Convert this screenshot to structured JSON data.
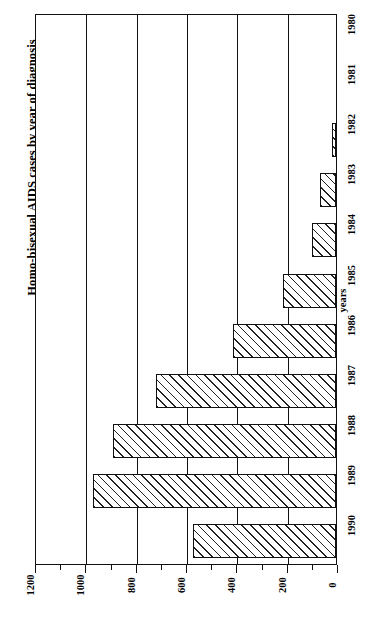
{
  "chart_data": {
    "type": "bar",
    "orientation": "horizontal",
    "title": "Homo-bisexual AIDS cases by year of diagnosis",
    "xlabel": "number of cases",
    "ylabel": "years",
    "categories": [
      "1980",
      "1981",
      "1982",
      "1983",
      "1984",
      "1985",
      "1986",
      "1987",
      "1988",
      "1989",
      "1990"
    ],
    "values": [
      0,
      0,
      15,
      65,
      95,
      210,
      410,
      715,
      885,
      965,
      570
    ],
    "value_ticks": [
      1200,
      1000,
      800,
      600,
      400,
      200,
      0
    ],
    "value_tick_labels": [
      "1200",
      "1000",
      "800",
      "600",
      "400",
      "200",
      "0"
    ],
    "minor_ticks": [
      1100,
      900,
      700,
      500,
      300,
      100
    ],
    "xlim": [
      0,
      1200
    ],
    "grid": true,
    "legend": "none",
    "bar_style": {
      "fill": "#ffffff",
      "hatch": "diagonal-45",
      "hatch_color": "#222222",
      "edge_color": "#111111"
    },
    "axis_color": "#111111",
    "background": "#ffffff",
    "rotation_note": "figure rendered rotated 90 degrees counter-clockwise"
  }
}
